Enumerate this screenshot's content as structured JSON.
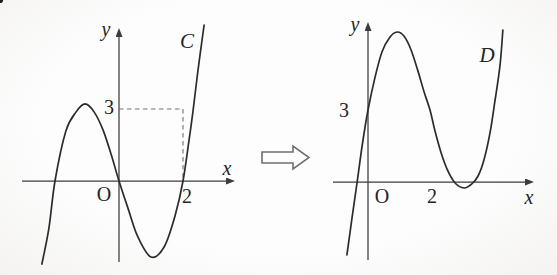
{
  "chart_data": [
    {
      "type": "line",
      "panel": "left",
      "curve_label": "C",
      "axis_labels": {
        "x": "x",
        "y": "y",
        "origin": "O"
      },
      "x_ticks": [
        {
          "value": 2,
          "label": "2"
        }
      ],
      "y_ticks": [
        {
          "value": 3,
          "label": "3"
        }
      ],
      "x_zeros": [
        -2,
        0,
        2
      ],
      "local_max": {
        "x": -1.1,
        "y": 3.2
      },
      "local_min": {
        "x": 1.0,
        "y": -3.2
      },
      "function_approx": "y = x^3 - 4x",
      "points": [
        [
          -2.41,
          -3.46
        ],
        [
          -2.19,
          -1.96
        ],
        [
          -2,
          0
        ],
        [
          -1.66,
          2.08
        ],
        [
          -1.34,
          2.88
        ],
        [
          -1.06,
          3.21
        ],
        [
          -0.78,
          2.88
        ],
        [
          -0.5,
          2.13
        ],
        [
          -0.22,
          1
        ],
        [
          0,
          0
        ],
        [
          0.28,
          -1.13
        ],
        [
          0.59,
          -2.33
        ],
        [
          1,
          -3.17
        ],
        [
          1.41,
          -2.75
        ],
        [
          1.75,
          -1.46
        ],
        [
          2,
          0
        ],
        [
          2.19,
          1.71
        ],
        [
          2.31,
          2.88
        ],
        [
          2.47,
          4.63
        ],
        [
          2.66,
          6.5
        ]
      ],
      "translation_vector": {
        "from": [
          0,
          0
        ],
        "to": [
          2,
          3
        ]
      },
      "guides": [
        [
          [
            0,
            3
          ],
          [
            2,
            3
          ]
        ],
        [
          [
            2,
            3
          ],
          [
            2,
            0
          ]
        ]
      ]
    },
    {
      "type": "line",
      "panel": "right",
      "curve_label": "D",
      "axis_labels": {
        "x": "x",
        "y": "y",
        "origin": "O"
      },
      "x_ticks": [
        {
          "value": 2,
          "label": "2"
        }
      ],
      "y_ticks": [
        {
          "value": 3,
          "label": "3"
        }
      ],
      "y_intercept": 3,
      "marked_point": [
        2,
        3
      ],
      "local_max": {
        "x": 0.9,
        "y": 6.25
      },
      "local_min": {
        "x": 3.1,
        "y": -0.25
      },
      "function_approx": "y = (x-2)^3 - 4(x-2) + 3",
      "points": [
        [
          -0.68,
          -3.04
        ],
        [
          -0.52,
          -1.54
        ],
        [
          -0.35,
          0
        ],
        [
          -0.19,
          1.5
        ],
        [
          0,
          3
        ],
        [
          0.23,
          4.38
        ],
        [
          0.45,
          5.42
        ],
        [
          0.71,
          6.04
        ],
        [
          0.94,
          6.25
        ],
        [
          1.16,
          6.08
        ],
        [
          1.39,
          5.5
        ],
        [
          1.61,
          4.63
        ],
        [
          1.81,
          3.75
        ],
        [
          2,
          3
        ],
        [
          2.16,
          2.13
        ],
        [
          2.35,
          1.25
        ],
        [
          2.55,
          0.54
        ],
        [
          2.81,
          -0.04
        ],
        [
          3.1,
          -0.25
        ],
        [
          3.35,
          -0.08
        ],
        [
          3.55,
          0.25
        ],
        [
          3.74,
          0.92
        ],
        [
          3.94,
          2.08
        ],
        [
          4.1,
          3.42
        ],
        [
          4.26,
          4.88
        ],
        [
          4.35,
          6.33
        ]
      ]
    }
  ]
}
